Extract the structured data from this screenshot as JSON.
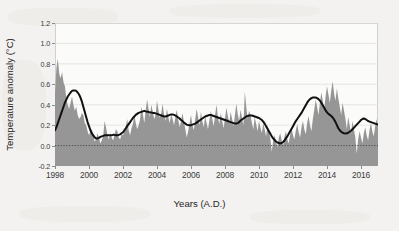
{
  "figure": {
    "background_color": "#f3f2f0",
    "plot_background_color": "#fbfbfa",
    "frame_color": "#d2d0cd"
  },
  "chart_data": {
    "type": "area",
    "title": "",
    "subtitle": "",
    "xlabel": "Years (A.D.)",
    "ylabel": "Temperature anomaly (°C)",
    "xlim": [
      1998.0,
      2017.0
    ],
    "ylim": [
      -0.2,
      1.2
    ],
    "grid": true,
    "grid_color": "#e2e0dd",
    "legend": null,
    "legend_position": "none",
    "zero_line": {
      "value": 0.0,
      "style": "dotted",
      "color": "#4a4a4a"
    },
    "xticks": [
      1998,
      2000,
      2002,
      2004,
      2006,
      2008,
      2010,
      2012,
      2014,
      2016
    ],
    "xticklabels": [
      "1998",
      "2000",
      "2002",
      "2004",
      "2006",
      "2008",
      "2010",
      "2012",
      "2014",
      "2016"
    ],
    "yticks": [
      -0.2,
      0.0,
      0.2,
      0.4,
      0.6,
      0.8,
      1.0,
      1.2
    ],
    "yticklabels": [
      "-0.2",
      "0.0",
      "0.2",
      "0.4",
      "0.6",
      "0.8",
      "1.0",
      "1.2"
    ],
    "series": [
      {
        "name": "Monthly temperature anomaly",
        "type": "area",
        "fill_color": "#969696",
        "line_color": "#969696",
        "baseline": -0.2,
        "x_start": 1998.0,
        "x_step": 0.0833333,
        "values": [
          0.52,
          0.76,
          0.85,
          0.7,
          0.66,
          0.72,
          0.62,
          0.58,
          0.46,
          0.4,
          0.36,
          0.42,
          0.48,
          0.4,
          0.34,
          0.38,
          0.3,
          0.26,
          0.28,
          0.32,
          0.3,
          0.22,
          0.2,
          0.14,
          0.1,
          0.14,
          0.16,
          0.1,
          0.04,
          0.06,
          0.12,
          0.08,
          0.02,
          0.05,
          0.09,
          0.24,
          0.18,
          0.1,
          0.06,
          0.12,
          0.08,
          0.05,
          0.1,
          0.16,
          0.14,
          0.08,
          0.06,
          0.11,
          0.1,
          0.14,
          0.19,
          0.26,
          0.15,
          0.1,
          0.17,
          0.21,
          0.3,
          0.22,
          0.16,
          0.2,
          0.25,
          0.38,
          0.31,
          0.22,
          0.34,
          0.45,
          0.36,
          0.28,
          0.4,
          0.33,
          0.26,
          0.3,
          0.44,
          0.35,
          0.27,
          0.32,
          0.41,
          0.3,
          0.24,
          0.36,
          0.28,
          0.22,
          0.31,
          0.26,
          0.2,
          0.28,
          0.35,
          0.25,
          0.18,
          0.24,
          0.32,
          0.23,
          0.16,
          0.08,
          0.14,
          0.22,
          0.3,
          0.2,
          0.15,
          0.26,
          0.36,
          0.28,
          0.2,
          0.33,
          0.24,
          0.18,
          0.29,
          0.22,
          0.16,
          0.25,
          0.34,
          0.26,
          0.19,
          0.3,
          0.4,
          0.28,
          0.21,
          0.32,
          0.24,
          0.17,
          0.27,
          0.37,
          0.29,
          0.22,
          0.33,
          0.26,
          0.19,
          0.3,
          0.41,
          0.31,
          0.24,
          0.35,
          0.27,
          0.2,
          0.53,
          0.38,
          0.26,
          0.34,
          0.3,
          0.22,
          0.16,
          0.28,
          0.21,
          0.14,
          0.24,
          0.18,
          0.12,
          0.22,
          0.16,
          0.09,
          0.2,
          0.14,
          0.07,
          -0.06,
          0.05,
          0.1,
          0.04,
          -0.02,
          0.08,
          0.12,
          0.05,
          0.0,
          0.09,
          0.14,
          0.06,
          0.02,
          0.11,
          0.17,
          0.1,
          0.06,
          0.15,
          0.21,
          0.13,
          0.08,
          0.18,
          0.24,
          0.16,
          0.11,
          0.22,
          0.29,
          0.2,
          0.14,
          0.26,
          0.35,
          0.45,
          0.38,
          0.3,
          0.42,
          0.52,
          0.44,
          0.36,
          0.48,
          0.58,
          0.5,
          0.42,
          0.54,
          0.63,
          0.51,
          0.44,
          0.56,
          0.46,
          0.38,
          0.3,
          0.42,
          0.34,
          0.26,
          0.16,
          0.28,
          0.2,
          0.12,
          0.24,
          0.16,
          0.08,
          -0.08,
          0.06,
          0.14,
          0.08,
          0.02,
          0.12,
          0.18,
          0.1,
          0.05,
          0.15,
          0.22,
          0.14,
          0.09,
          0.19,
          0.26,
          0.18,
          0.12,
          0.22,
          0.29,
          0.2,
          0.15,
          0.25,
          0.32,
          0.23,
          0.17,
          0.27,
          0.34,
          0.24,
          0.18,
          0.28,
          0.36,
          0.26,
          0.2,
          0.3,
          0.38,
          0.28,
          0.22,
          0.32,
          0.4,
          0.3,
          0.24,
          0.34,
          0.42,
          0.32,
          0.26,
          0.36,
          0.45,
          0.35,
          0.28,
          0.4,
          0.48,
          0.38,
          0.3,
          0.44,
          0.55,
          0.46,
          0.38,
          0.52,
          0.64,
          0.72,
          0.85,
          0.97,
          0.82,
          0.68,
          0.58,
          0.52,
          0.62,
          0.55,
          0.48,
          0.58,
          0.64,
          0.56,
          0.5,
          0.6,
          0.55
        ]
      },
      {
        "name": "Smoothed trend",
        "type": "line",
        "line_color": "#111111",
        "line_width": 2.0,
        "x_start": 1998.0,
        "x_step": 0.0833333,
        "values": [
          0.15,
          0.18,
          0.22,
          0.26,
          0.3,
          0.34,
          0.38,
          0.42,
          0.45,
          0.48,
          0.5,
          0.52,
          0.535,
          0.54,
          0.54,
          0.535,
          0.52,
          0.5,
          0.47,
          0.43,
          0.38,
          0.33,
          0.28,
          0.23,
          0.19,
          0.15,
          0.12,
          0.1,
          0.08,
          0.07,
          0.07,
          0.075,
          0.085,
          0.09,
          0.095,
          0.1,
          0.1,
          0.1,
          0.1,
          0.1,
          0.1,
          0.105,
          0.105,
          0.1,
          0.1,
          0.105,
          0.11,
          0.12,
          0.13,
          0.15,
          0.17,
          0.19,
          0.21,
          0.23,
          0.25,
          0.27,
          0.285,
          0.3,
          0.31,
          0.32,
          0.325,
          0.33,
          0.335,
          0.34,
          0.335,
          0.33,
          0.33,
          0.325,
          0.325,
          0.32,
          0.32,
          0.315,
          0.31,
          0.305,
          0.3,
          0.295,
          0.29,
          0.285,
          0.285,
          0.29,
          0.295,
          0.3,
          0.305,
          0.305,
          0.3,
          0.295,
          0.285,
          0.275,
          0.265,
          0.25,
          0.24,
          0.225,
          0.215,
          0.205,
          0.2,
          0.2,
          0.2,
          0.205,
          0.21,
          0.215,
          0.225,
          0.235,
          0.245,
          0.255,
          0.265,
          0.275,
          0.285,
          0.29,
          0.295,
          0.3,
          0.3,
          0.295,
          0.29,
          0.285,
          0.28,
          0.275,
          0.27,
          0.265,
          0.26,
          0.255,
          0.25,
          0.245,
          0.24,
          0.235,
          0.23,
          0.225,
          0.22,
          0.215,
          0.215,
          0.22,
          0.23,
          0.245,
          0.255,
          0.265,
          0.275,
          0.285,
          0.29,
          0.295,
          0.295,
          0.295,
          0.29,
          0.285,
          0.28,
          0.275,
          0.27,
          0.26,
          0.25,
          0.235,
          0.215,
          0.19,
          0.165,
          0.14,
          0.115,
          0.09,
          0.07,
          0.055,
          0.04,
          0.03,
          0.025,
          0.02,
          0.025,
          0.035,
          0.05,
          0.07,
          0.09,
          0.115,
          0.14,
          0.165,
          0.19,
          0.215,
          0.24,
          0.26,
          0.28,
          0.3,
          0.32,
          0.345,
          0.37,
          0.395,
          0.42,
          0.44,
          0.455,
          0.465,
          0.47,
          0.47,
          0.47,
          0.465,
          0.455,
          0.44,
          0.42,
          0.395,
          0.37,
          0.345,
          0.325,
          0.31,
          0.3,
          0.29,
          0.275,
          0.255,
          0.23,
          0.2,
          0.17,
          0.15,
          0.135,
          0.125,
          0.12,
          0.118,
          0.12,
          0.125,
          0.135,
          0.145,
          0.16,
          0.175,
          0.19,
          0.205,
          0.22,
          0.235,
          0.25,
          0.26,
          0.265,
          0.26,
          0.25,
          0.24,
          0.235,
          0.23,
          0.225,
          0.22,
          0.215,
          0.21,
          0.205,
          0.205,
          0.205,
          0.21,
          0.215,
          0.22,
          0.225,
          0.235,
          0.245,
          0.255,
          0.265,
          0.275,
          0.28,
          0.285,
          0.29,
          0.29,
          0.29,
          0.295,
          0.3,
          0.305,
          0.31,
          0.315,
          0.32,
          0.325,
          0.33,
          0.34,
          0.355,
          0.375,
          0.4,
          0.43,
          0.46,
          0.49,
          0.52,
          0.545,
          0.565,
          0.58,
          0.59,
          0.595,
          0.6,
          0.6,
          0.595,
          0.59,
          0.585,
          0.58,
          0.575,
          0.575,
          0.58,
          0.585
        ]
      }
    ]
  }
}
